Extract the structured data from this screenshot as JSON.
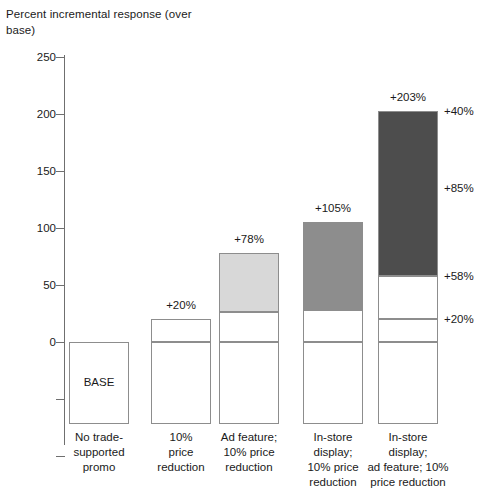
{
  "chart_data": {
    "type": "bar",
    "title": "",
    "ylabel": "Percent incremental response (over base)",
    "xlabel": "",
    "ylim": [
      -100,
      275
    ],
    "yticks": [
      250,
      200,
      150,
      100,
      50,
      0,
      -50,
      -100
    ],
    "ytick_labels": [
      "250",
      "200",
      "150",
      "100",
      "50",
      "0",
      "",
      ""
    ],
    "grid": false,
    "legend": "none",
    "base_label": "BASE",
    "categories": [
      "No trade-supported promo",
      "10% price reduction",
      "Ad feature; 10% price reduction",
      "In-store display; 10% price reduction",
      "In-store display; ad feature; 10% price reduction"
    ],
    "category_lines": [
      [
        "No trade-",
        "supported",
        "promo"
      ],
      [
        "10%",
        "price",
        "reduction"
      ],
      [
        "Ad feature;",
        "10% price",
        "reduction"
      ],
      [
        "In-store",
        "display;",
        "10% price",
        "reduction"
      ],
      [
        "In-store",
        "display;",
        "ad feature; 10%",
        "price reduction"
      ]
    ],
    "total_labels": [
      "",
      "+20%",
      "+78%",
      "+105%",
      "+203%"
    ],
    "totals": [
      0,
      20,
      78,
      105,
      203
    ],
    "bars": [
      {
        "name": "No trade-supported promo",
        "total_label": "",
        "segments": [
          {
            "name": "base",
            "from": -72,
            "to": 0,
            "value": 0,
            "color": "#ffffff",
            "text": "BASE"
          }
        ]
      },
      {
        "name": "10% price reduction",
        "total_label": "+20%",
        "segments": [
          {
            "name": "base",
            "from": -72,
            "to": 0,
            "value": 0,
            "color": "#ffffff",
            "text": ""
          },
          {
            "name": "price-reduction",
            "from": 0,
            "to": 20,
            "value": 20,
            "color": "#ffffff",
            "text": ""
          }
        ]
      },
      {
        "name": "Ad feature; 10% price reduction",
        "total_label": "+78%",
        "segments": [
          {
            "name": "base",
            "from": -72,
            "to": 0,
            "value": 0,
            "color": "#ffffff",
            "text": ""
          },
          {
            "name": "price-reduction",
            "from": 0,
            "to": 26,
            "value": 26,
            "color": "#ffffff",
            "text": ""
          },
          {
            "name": "ad-feature",
            "from": 26,
            "to": 78,
            "value": 52,
            "color": "#d8d8d8",
            "text": ""
          }
        ]
      },
      {
        "name": "In-store display; 10% price reduction",
        "total_label": "+105%",
        "segments": [
          {
            "name": "base",
            "from": -72,
            "to": 0,
            "value": 0,
            "color": "#ffffff",
            "text": ""
          },
          {
            "name": "price-reduction",
            "from": 0,
            "to": 28,
            "value": 28,
            "color": "#ffffff",
            "text": ""
          },
          {
            "name": "in-store-display",
            "from": 28,
            "to": 105,
            "value": 77,
            "color": "#8d8d8d",
            "text": ""
          }
        ]
      },
      {
        "name": "In-store display; ad feature; 10% price reduction",
        "total_label": "+203%",
        "segments": [
          {
            "name": "base",
            "from": -72,
            "to": 0,
            "value": 0,
            "color": "#ffffff",
            "text": ""
          },
          {
            "name": "price-reduction",
            "from": 0,
            "to": 20,
            "value": 20,
            "color": "#ffffff",
            "text": ""
          },
          {
            "name": "display-uplift",
            "from": 20,
            "to": 58,
            "value": 38,
            "color": "#ffffff",
            "text": ""
          },
          {
            "name": "combined-uplift",
            "from": 58,
            "to": 203,
            "value": 145,
            "color": "#4d4d4d",
            "text": ""
          }
        ]
      }
    ],
    "right_annotations": [
      {
        "name": "annotation-plus-40",
        "label": "+40%",
        "at": 203
      },
      {
        "name": "annotation-plus-85",
        "label": "+85%",
        "at": 135
      },
      {
        "name": "annotation-plus-58",
        "label": "+58%",
        "at": 58
      },
      {
        "name": "annotation-plus-20",
        "label": "+20%",
        "at": 20
      }
    ],
    "colors": {
      "light_gray": "#d8d8d8",
      "mid_gray": "#8d8d8d",
      "dark_gray": "#4d4d4d",
      "outline": "#8d8d8d",
      "axis": "#6f6f6f",
      "text": "#1a1a1a"
    }
  }
}
